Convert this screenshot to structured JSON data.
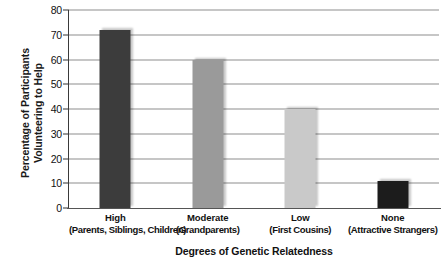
{
  "chart_data": {
    "type": "bar",
    "title": "",
    "xlabel": "Degrees of Genetic Relatedness",
    "ylabel": "Percentage of Participants Volunteering to Help",
    "ylabel_line1": "Percentage of Participants",
    "ylabel_line2": "Volunteering to Help",
    "categories": [
      "High",
      "Moderate",
      "Low",
      "None"
    ],
    "category_sublabels": [
      "(Parents, Siblings, Children)",
      "(Grandparents)",
      "(First Cousins)",
      "(Attractive Strangers)"
    ],
    "values": [
      72,
      60,
      40,
      11
    ],
    "ylim": [
      0,
      80
    ],
    "ytick_values": [
      0,
      10,
      20,
      30,
      40,
      50,
      60,
      70,
      80
    ],
    "ytick_labels": [
      "0",
      "10",
      "20",
      "30",
      "40",
      "50",
      "60",
      "70",
      "80"
    ],
    "grid": true,
    "legend": "none",
    "bar_colors": [
      "#3c3c3c",
      "#9a9a9a",
      "#c9c9c9",
      "#1c1c1c"
    ]
  },
  "colors": {
    "background": "#ffffff",
    "axis": "#3a3a3a",
    "gridline": "#8e8e8e",
    "text": "#111111"
  }
}
